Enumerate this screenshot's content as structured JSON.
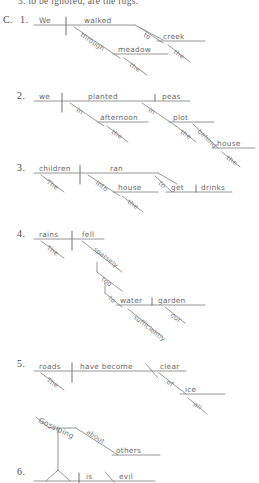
{
  "page": {
    "background_color": "#ffffff",
    "ink_color": "#6b6b6b",
    "rule_color": "#8a8a8a",
    "top_fragment": "3. to be ignored, are the rugs.",
    "section_label": "C."
  },
  "exercises": [
    {
      "number": "1.",
      "sentence": "We walked through the meadow to the creek.",
      "words": {
        "subject": "We",
        "verb": "walked",
        "prep1": "through",
        "prep1_object": "meadow",
        "prep1_article": "the",
        "prep2": "to",
        "prep2_object": "creek",
        "prep2_article": "the"
      }
    },
    {
      "number": "2.",
      "sentence": "we planted peas in the afternoon in the plot behind the house.",
      "words": {
        "subject": "we",
        "verb": "planted",
        "object": "peas",
        "prep1": "in",
        "prep1_object": "afternoon",
        "prep1_article": "the",
        "prep2": "in",
        "prep2_object": "plot",
        "prep2_article": "the",
        "prep3": "behind",
        "prep3_object": "house",
        "prep3_article": "the"
      }
    },
    {
      "number": "3.",
      "sentence": "The children ran into the house to get drinks.",
      "words": {
        "subject": "children",
        "subject_article": "The",
        "verb": "ran",
        "prep1": "into",
        "prep1_object": "house",
        "prep1_article": "the",
        "infinitive_to": "to",
        "infinitive_verb": "get",
        "infinitive_object": "drinks"
      }
    },
    {
      "number": "4.",
      "sentence": "The rains fell too sparsely to water our garden sufficiently.",
      "words": {
        "subject": "rains",
        "subject_article": "The",
        "verb": "fell",
        "adverb1": "sparsely",
        "adverb2": "too",
        "infinitive_to": "to",
        "infinitive_verb": "water",
        "infinitive_object": "garden",
        "object_modifier": "our",
        "adverb3": "sufficiently"
      }
    },
    {
      "number": "5.",
      "sentence": "The roads have become clear of all ice.",
      "words": {
        "subject": "roads",
        "subject_article": "The",
        "verb": "have become",
        "complement": "clear",
        "prep1": "of",
        "prep1_object": "ice",
        "prep1_modifier": "all"
      }
    },
    {
      "number": "6.",
      "sentence": "Gossiping about others is evil.",
      "words": {
        "gerund": "Gossiping",
        "prep1": "about",
        "prep1_object": "others",
        "verb": "is",
        "complement": "evil"
      }
    }
  ]
}
